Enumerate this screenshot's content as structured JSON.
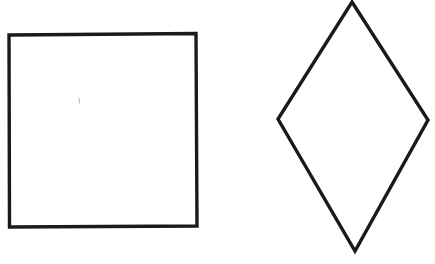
{
  "canvas": {
    "width": 435,
    "height": 264,
    "background_color": "#ffffff",
    "ink_color": "#1a1a1a"
  },
  "figure": {
    "description": "Two hand-drawn black outline geometric shapes on a plain white background",
    "shape_count": 2,
    "medium": "ink line drawing"
  },
  "shapes": [
    {
      "id": "square",
      "name": "square",
      "position": "left",
      "stroke_color": "#1a1a1a",
      "stroke_width": 3.4,
      "fill": "none",
      "bounds": {
        "x": 8,
        "y": 33,
        "width": 189,
        "height": 194
      },
      "points": "9,35 196,33.5 197,226 9.5,227",
      "vertices": [
        {
          "label": "top-left",
          "x": 9,
          "y": 35
        },
        {
          "label": "top-right",
          "x": 196,
          "y": 33.5
        },
        {
          "label": "bottom-right",
          "x": 197,
          "y": 226
        },
        {
          "label": "bottom-left",
          "x": 9.5,
          "y": 227
        }
      ]
    },
    {
      "id": "rhombus",
      "name": "rhombus",
      "position": "right",
      "stroke_color": "#1a1a1a",
      "stroke_width": 3.4,
      "fill": "none",
      "bounds": {
        "x": 277,
        "y": 1,
        "width": 152,
        "height": 252
      },
      "points": "352,2 428,120 355,251 278,119",
      "vertices": [
        {
          "label": "top",
          "x": 352,
          "y": 2
        },
        {
          "label": "right",
          "x": 428,
          "y": 120
        },
        {
          "label": "bottom",
          "x": 355,
          "y": 251
        },
        {
          "label": "left",
          "x": 278,
          "y": 119
        }
      ]
    }
  ],
  "marks": [
    {
      "id": "stray-mark",
      "name": "faint-pen-mark",
      "x": 79,
      "y": 100,
      "length": 5,
      "stroke_color": "#b5b5b5",
      "stroke_width": 1
    }
  ]
}
